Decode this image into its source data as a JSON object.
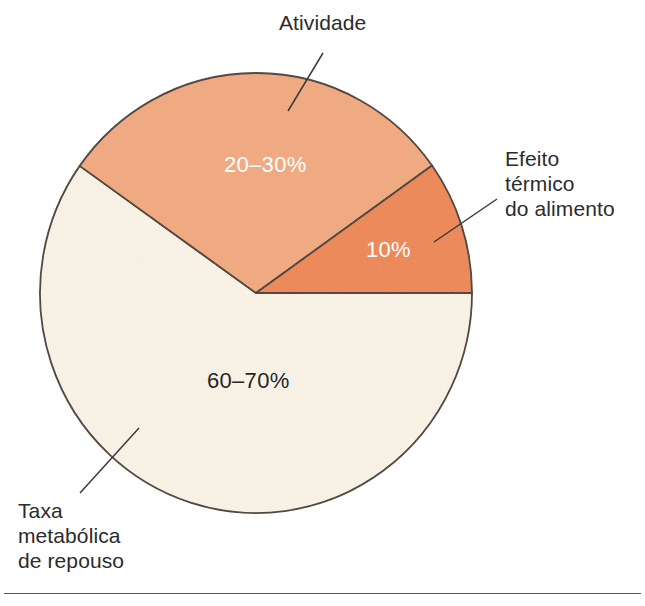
{
  "figure": {
    "background_color": "#ffffff",
    "bottom_rule_color": "#555555",
    "outline_color": "#4a3b33",
    "leader_line_color": "#3a3a3a"
  },
  "chart_data": {
    "type": "pie",
    "title": "",
    "subtitle": "",
    "xlabel": "",
    "ylabel": "",
    "grid": false,
    "legend_position": "callout-labels",
    "center": {
      "x": 256,
      "y": 293
    },
    "radius": {
      "x": 216,
      "y": 220
    },
    "start_angle_deg": 0,
    "direction": "counterclockwise",
    "categories": [
      "Efeito térmico do alimento",
      "Atividade",
      "Taxa metabólica de repouso"
    ],
    "values": [
      10,
      25,
      65
    ],
    "value_labels": [
      "10%",
      "20–30%",
      "60–70%"
    ],
    "slices": [
      {
        "name": "Efeito térmico do alimento",
        "label": "Efeito\ntérmico\ndo alimento",
        "value_label": "10%",
        "value": 10,
        "range_min": 10,
        "range_max": 10,
        "color": "#ee8752",
        "text_color": "#ffffff",
        "start_angle_deg": 0,
        "end_angle_deg": 35.4
      },
      {
        "name": "Atividade",
        "label": "Atividade",
        "value_label": "20–30%",
        "value": 25,
        "range_min": 20,
        "range_max": 30,
        "color": "#f2a97e",
        "text_color": "#ffffff",
        "start_angle_deg": 35.4,
        "end_angle_deg": 144.7
      },
      {
        "name": "Taxa metabólica de repouso",
        "label": "Taxa\nmetabólica\nde repouso",
        "value_label": "60–70%",
        "value": 65,
        "range_min": 60,
        "range_max": 70,
        "color": "#faf3e6",
        "text_color": "#262626",
        "start_angle_deg": 144.7,
        "end_angle_deg": 360
      }
    ]
  },
  "callouts": {
    "activity": {
      "text": "Atividade",
      "leader": {
        "x1": 323,
        "y1": 53,
        "x2": 288,
        "y2": 111
      }
    },
    "thermic": {
      "text": "Efeito\ntérmico\ndo alimento",
      "leader": {
        "x1": 497,
        "y1": 199,
        "x2": 434,
        "y2": 242
      }
    },
    "resting": {
      "text": "Taxa\nmetabólica\nde repouso",
      "leader": {
        "x1": 80,
        "y1": 493,
        "x2": 139,
        "y2": 428
      }
    }
  }
}
